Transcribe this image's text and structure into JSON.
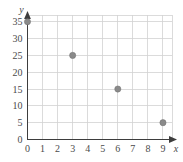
{
  "chart_data": {
    "type": "scatter",
    "title": "",
    "subtitle": "",
    "xlabel": "x",
    "ylabel": "y",
    "xlim": [
      0,
      9.6
    ],
    "ylim": [
      0,
      37
    ],
    "grid": true,
    "legend": null,
    "x": [
      0,
      3,
      6,
      9
    ],
    "y": [
      35,
      25,
      15,
      5
    ],
    "points": [
      {
        "x": 0,
        "y": 35
      },
      {
        "x": 3,
        "y": 25
      },
      {
        "x": 6,
        "y": 15
      },
      {
        "x": 9,
        "y": 5
      }
    ],
    "xticks": [
      0,
      1,
      2,
      3,
      4,
      5,
      6,
      7,
      8,
      9
    ],
    "xtick_labels": [
      "0",
      "1",
      "2",
      "3",
      "4",
      "5",
      "6",
      "7",
      "8",
      "9"
    ],
    "yticks": [
      0,
      5,
      10,
      15,
      20,
      25,
      30,
      35
    ],
    "ytick_labels": [
      "0",
      "5",
      "10",
      "15",
      "20",
      "25",
      "30",
      "35"
    ],
    "marker_color": "#8a8a8a",
    "grid_color": "#d2d2d2",
    "axis_color": "#3d3d3d",
    "label_color": "#4a4a4a",
    "background_color": "#ffffff"
  },
  "axes": {
    "x_name": "x",
    "y_name": "y"
  }
}
